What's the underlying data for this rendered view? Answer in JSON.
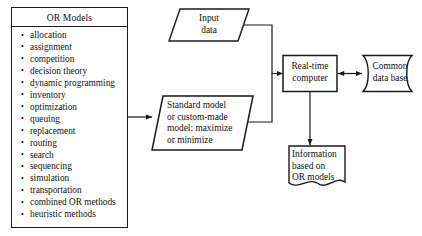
{
  "diagram": {
    "colors": {
      "stroke": "#1a1a1a",
      "text": "#111111",
      "background": "#ffffff"
    },
    "or_panel": {
      "header": "OR Models",
      "items": [
        "allocation",
        "assignment",
        "competition",
        "decision theory",
        "dynamic programming",
        "inventory",
        "optimization",
        "queuing",
        "replacement",
        "routing",
        "search",
        "sequencing",
        "simulation",
        "transportation",
        "combined OR methods",
        "heuristic methods"
      ]
    },
    "nodes": {
      "input_data": {
        "label": "Input\ndata",
        "shape": "parallelogram"
      },
      "standard_model": {
        "label": "Standard model\nor custom-made\nmodel: maximize\nor minimize",
        "shape": "parallelogram"
      },
      "real_time_computer": {
        "label": "Real-time\ncomputer",
        "shape": "rectangle"
      },
      "common_data_base": {
        "label": "Common\ndata base",
        "shape": "direct-access-storage"
      },
      "information_output": {
        "label": "Information\nbased on\nOR models",
        "shape": "document"
      }
    },
    "connectors": [
      {
        "name": "or-models-to-standard-model",
        "from": "or_panel",
        "to": "standard_model",
        "arrow": "single"
      },
      {
        "name": "input-data-to-computer",
        "from": "input_data",
        "to": "real_time_computer",
        "arrow": "single"
      },
      {
        "name": "standard-model-to-computer",
        "from": "standard_model",
        "to": "real_time_computer",
        "arrow": "single"
      },
      {
        "name": "computer-to-database",
        "from": "real_time_computer",
        "to": "common_data_base",
        "arrow": "double"
      },
      {
        "name": "computer-to-information",
        "from": "real_time_computer",
        "to": "information_output",
        "arrow": "single"
      }
    ]
  }
}
